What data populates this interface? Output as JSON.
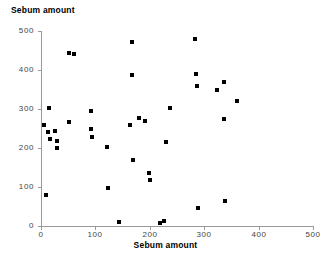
{
  "chart_data": {
    "type": "scatter",
    "title": "",
    "xlabel": "Sebum amount",
    "ylabel": "Sebum amount",
    "xlim": [
      0,
      500
    ],
    "ylim": [
      0,
      500
    ],
    "xticks": [
      0,
      100,
      200,
      300,
      400,
      500
    ],
    "yticks": [
      0,
      100,
      200,
      300,
      400,
      500
    ],
    "xtick_labels": [
      "0",
      "100",
      "200",
      "300",
      "400",
      "500"
    ],
    "ytick_labels": [
      "0",
      "100",
      "200",
      "300",
      "400",
      "500"
    ],
    "grid": false,
    "legend": null,
    "marker": "square",
    "marker_color": "#000000",
    "points": [
      {
        "x": 6,
        "y": 258
      },
      {
        "x": 9,
        "y": 80
      },
      {
        "x": 12,
        "y": 240
      },
      {
        "x": 14,
        "y": 302
      },
      {
        "x": 16,
        "y": 222
      },
      {
        "x": 26,
        "y": 244
      },
      {
        "x": 29,
        "y": 217
      },
      {
        "x": 30,
        "y": 199
      },
      {
        "x": 51,
        "y": 443
      },
      {
        "x": 52,
        "y": 267
      },
      {
        "x": 60,
        "y": 441
      },
      {
        "x": 91,
        "y": 249
      },
      {
        "x": 92,
        "y": 294
      },
      {
        "x": 93,
        "y": 228
      },
      {
        "x": 122,
        "y": 203
      },
      {
        "x": 124,
        "y": 98
      },
      {
        "x": 143,
        "y": 11
      },
      {
        "x": 163,
        "y": 260
      },
      {
        "x": 167,
        "y": 471
      },
      {
        "x": 168,
        "y": 388
      },
      {
        "x": 169,
        "y": 170
      },
      {
        "x": 180,
        "y": 276
      },
      {
        "x": 192,
        "y": 268
      },
      {
        "x": 198,
        "y": 137
      },
      {
        "x": 201,
        "y": 119
      },
      {
        "x": 219,
        "y": 7
      },
      {
        "x": 226,
        "y": 13
      },
      {
        "x": 229,
        "y": 216
      },
      {
        "x": 238,
        "y": 303
      },
      {
        "x": 283,
        "y": 480
      },
      {
        "x": 285,
        "y": 389
      },
      {
        "x": 286,
        "y": 360
      },
      {
        "x": 289,
        "y": 45
      },
      {
        "x": 324,
        "y": 348
      },
      {
        "x": 336,
        "y": 368
      },
      {
        "x": 337,
        "y": 274
      },
      {
        "x": 338,
        "y": 63
      },
      {
        "x": 360,
        "y": 321
      }
    ]
  },
  "axes": {
    "y_title": "Sebum amount",
    "x_title": "Sebum amount"
  }
}
